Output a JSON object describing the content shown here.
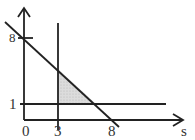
{
  "diagram": {
    "type": "feasible-region",
    "x_axis_label": "s",
    "y_axis_label": "",
    "origin_label": "0",
    "x_tick_labels": [
      "3",
      "8"
    ],
    "y_tick_labels": [
      "8",
      "1"
    ],
    "lines": [
      {
        "name": "diagonal",
        "equation": "s + y = 8"
      },
      {
        "name": "vertical",
        "equation": "s = 3"
      },
      {
        "name": "horizontal",
        "equation": "y = 1"
      }
    ],
    "shaded_region": {
      "vertices": [
        [
          3,
          5
        ],
        [
          3,
          1
        ],
        [
          7,
          1
        ]
      ],
      "fill": "#d4d4d4"
    },
    "colors": {
      "line": "#222222",
      "text": "#333333",
      "shade": "#d4d4d4"
    }
  }
}
